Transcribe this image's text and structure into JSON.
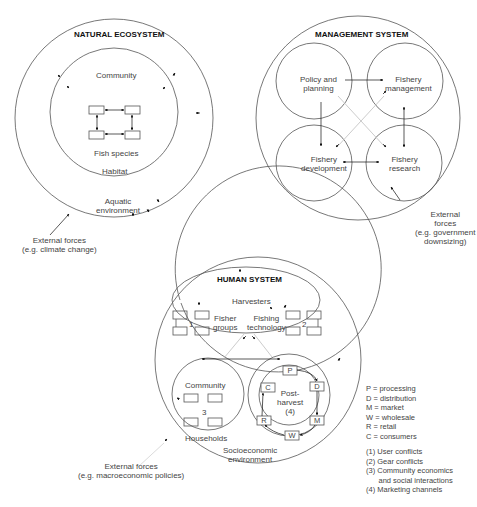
{
  "natural_ecosystem": {
    "title": "NATURAL ECOSYSTEM",
    "community": "Community",
    "fish_species": "Fish species",
    "habitat": "Habitat",
    "aquatic_line1": "Aquatic",
    "aquatic_line2": "environment",
    "external_line1": "External forces",
    "external_line2": "(e.g. climate change)"
  },
  "management_system": {
    "title": "MANAGEMENT SYSTEM",
    "policy_line1": "Policy and",
    "policy_line2": "planning",
    "mgmt_line1": "Fishery",
    "mgmt_line2": "management",
    "dev_line1": "Fishery",
    "dev_line2": "development",
    "research_line1": "Fishery",
    "research_line2": "research",
    "external_line1": "External",
    "external_line2": "forces",
    "external_line3": "(e.g. government",
    "external_line4": "downsizing)"
  },
  "human_system": {
    "title": "HUMAN SYSTEM",
    "harvesters": "Harvesters",
    "fisher_line1": "Fisher",
    "fisher_line2": "groups",
    "tech_line1": "Fishing",
    "tech_line2": "technology",
    "num1": "1",
    "num2": "2",
    "num3": "3",
    "community": "Community",
    "households": "Households",
    "post_line1": "Post-",
    "post_line2": "harvest",
    "post_line3": "(4)",
    "socio_line1": "Socioeconomic",
    "socio_line2": "environment",
    "boxes": {
      "p": "P",
      "d": "D",
      "m": "M",
      "w": "W",
      "r": "R",
      "c": "C"
    },
    "external_line1": "External forces",
    "external_line2": "(e.g. macroeconomic policies)"
  },
  "legend": {
    "abbreviations": [
      "P = processing",
      "D = distribution",
      "M = market",
      "W = wholesale",
      "R =  retail",
      "C = consumers"
    ],
    "notes": [
      "(1) User conflicts",
      "(2) Gear conflicts",
      "(3) Community economics",
      "      and social interactions",
      "(4) Marketing channels"
    ]
  }
}
